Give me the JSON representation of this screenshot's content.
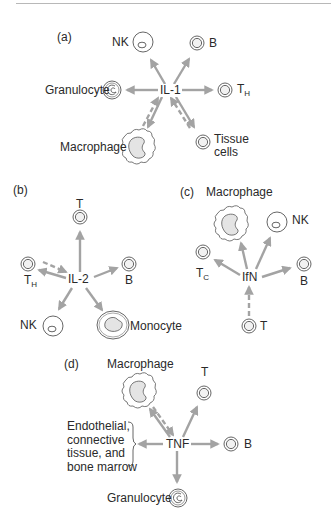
{
  "panels": [
    {
      "id": "a",
      "label": "(a)",
      "cytokine": "IL-1",
      "targets": [
        {
          "name": "NK",
          "cell": "nk-cell"
        },
        {
          "name": "B",
          "cell": "lymphocyte"
        },
        {
          "name": "Granulocyte",
          "cell": "granulocyte"
        },
        {
          "name": "T",
          "subscript": "H",
          "cell": "lymphocyte"
        }
      ],
      "sources": [
        {
          "name": "Macrophage",
          "cell": "macrophage",
          "bidirectional": true
        },
        {
          "name": "Tissue",
          "name_line2": "cells",
          "cell": "lymphocyte",
          "bidirectional": true
        }
      ]
    },
    {
      "id": "b",
      "label": "(b)",
      "cytokine": "IL-2",
      "targets": [
        {
          "name": "T",
          "cell": "lymphocyte"
        },
        {
          "name": "B",
          "cell": "lymphocyte"
        },
        {
          "name": "NK",
          "cell": "nk-cell"
        },
        {
          "name": "Monocyte",
          "cell": "monocyte"
        }
      ],
      "sources": [
        {
          "name": "T",
          "subscript": "H",
          "cell": "lymphocyte",
          "bidirectional": true
        }
      ]
    },
    {
      "id": "c",
      "label": "(c)",
      "cytokine": "IfN",
      "targets": [
        {
          "name": "Macrophage",
          "cell": "macrophage"
        },
        {
          "name": "NK",
          "cell": "nk-cell"
        },
        {
          "name": "T",
          "subscript": "C",
          "cell": "lymphocyte"
        },
        {
          "name": "B",
          "cell": "lymphocyte"
        }
      ],
      "sources": [
        {
          "name": "T",
          "cell": "lymphocyte",
          "bidirectional": false
        }
      ]
    },
    {
      "id": "d",
      "label": "(d)",
      "cytokine": "TNF",
      "targets": [
        {
          "name": "T",
          "cell": "lymphocyte"
        },
        {
          "name": "B",
          "cell": "lymphocyte"
        },
        {
          "name": "Granulocyte",
          "cell": "granulocyte"
        },
        {
          "name": "Endothelial, connective tissue, and bone marrow",
          "lines": [
            "Endothelial,",
            "connective",
            "tissue, and",
            "bone marrow"
          ],
          "cell": "bracket"
        }
      ],
      "sources": [
        {
          "name": "Macrophage",
          "cell": "macrophage",
          "bidirectional": true
        }
      ]
    }
  ],
  "legend_semantics": {
    "solid_arrow": "cytokine acts on target cell",
    "dashed_arrow": "cell produces cytokine"
  },
  "colors": {
    "arrow": "#a3a3a3",
    "cell_outline": "#555555",
    "nucleus_fill": "#e4e4e4",
    "text": "#2a2a2a",
    "rule": "#b8b8b8"
  }
}
